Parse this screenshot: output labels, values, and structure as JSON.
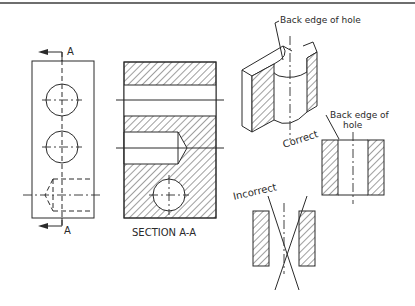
{
  "figure": {
    "top_rule_color": "#6e6e6e",
    "line_color": "#2a2a2a",
    "background": "#ffffff"
  },
  "front_view": {
    "cut_plane_label_top": "A",
    "cut_plane_label_bottom": "A"
  },
  "section_view": {
    "caption": "SECTION A-A"
  },
  "isometric_view": {
    "leader_label": "Back edge of hole"
  },
  "correct_view": {
    "title": "Correct",
    "leader_label_line1": "Back edge of",
    "leader_label_line2": "hole"
  },
  "incorrect_view": {
    "title": "Incorrect"
  }
}
